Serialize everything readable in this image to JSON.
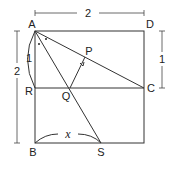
{
  "diagram": {
    "points": {
      "A": {
        "label": "A",
        "x": 35,
        "y": 31
      },
      "D": {
        "label": "D",
        "x": 144,
        "y": 31
      },
      "C": {
        "label": "C",
        "x": 144,
        "y": 88
      },
      "B": {
        "label": "B",
        "x": 35,
        "y": 143
      },
      "R": {
        "label": "R",
        "x": 35,
        "y": 88
      },
      "Q": {
        "label": "Q",
        "x": 70,
        "y": 88
      },
      "P": {
        "label": "P",
        "x": 85,
        "y": 57
      },
      "S": {
        "label": "S",
        "x": 101,
        "y": 143
      }
    },
    "dimensions": {
      "top": "2",
      "left": "2",
      "right": "1",
      "arc_AR": "1"
    },
    "angle_label": "x",
    "colors": {
      "stroke": "#333333",
      "text": "#222222",
      "background": "#ffffff"
    }
  }
}
